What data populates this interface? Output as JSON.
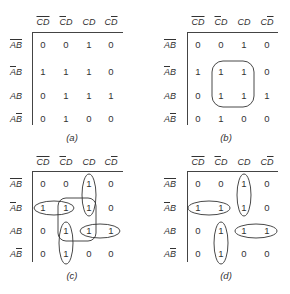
{
  "figure": {
    "column_headers": [
      {
        "parts": [
          {
            "t": "C",
            "bar": true
          },
          {
            "t": "D",
            "bar": true
          }
        ],
        "text": "C̄D̄"
      },
      {
        "parts": [
          {
            "t": "C",
            "bar": true
          },
          {
            "t": "D",
            "bar": false
          }
        ],
        "text": "C̄D"
      },
      {
        "parts": [
          {
            "t": "C",
            "bar": false
          },
          {
            "t": "D",
            "bar": false
          }
        ],
        "text": "CD"
      },
      {
        "parts": [
          {
            "t": "C",
            "bar": false
          },
          {
            "t": "D",
            "bar": true
          }
        ],
        "text": "CD̄"
      }
    ],
    "row_headers": [
      {
        "parts": [
          {
            "t": "A",
            "bar": true
          },
          {
            "t": "B",
            "bar": true
          }
        ],
        "text": "ĀB̄"
      },
      {
        "parts": [
          {
            "t": "A",
            "bar": true
          },
          {
            "t": "B",
            "bar": false
          }
        ],
        "text": "ĀB"
      },
      {
        "parts": [
          {
            "t": "A",
            "bar": false
          },
          {
            "t": "B",
            "bar": false
          }
        ],
        "text": "AB"
      },
      {
        "parts": [
          {
            "t": "A",
            "bar": false
          },
          {
            "t": "B",
            "bar": true
          }
        ],
        "text": "AB̄"
      }
    ],
    "maps": [
      {
        "id": "a",
        "caption": "(a)",
        "cells": [
          [
            "0",
            "0",
            "1",
            "0"
          ],
          [
            "1",
            "1",
            "1",
            "0"
          ],
          [
            "0",
            "1",
            "1",
            "1"
          ],
          [
            "0",
            "1",
            "0",
            "0"
          ]
        ],
        "groupings": []
      },
      {
        "id": "b",
        "caption": "(b)",
        "cells": [
          [
            "0",
            "0",
            "1",
            "0"
          ],
          [
            "1",
            "1",
            "1",
            "0"
          ],
          [
            "0",
            "1",
            "1",
            "1"
          ],
          [
            "0",
            "1",
            "0",
            "0"
          ]
        ],
        "groupings": [
          {
            "shape": "rounded-rect",
            "rows": [
              1,
              2
            ],
            "cols": [
              1,
              2
            ]
          }
        ]
      },
      {
        "id": "c",
        "caption": "(c)",
        "cells": [
          [
            "0",
            "0",
            "1",
            "0"
          ],
          [
            "1",
            "1",
            "1",
            "0"
          ],
          [
            "0",
            "1",
            "1",
            "1"
          ],
          [
            "0",
            "1",
            "0",
            "0"
          ]
        ],
        "groupings": [
          {
            "shape": "ellipse",
            "rows": [
              0,
              1
            ],
            "cols": [
              2,
              2
            ]
          },
          {
            "shape": "ellipse",
            "rows": [
              1,
              1
            ],
            "cols": [
              0,
              1
            ]
          },
          {
            "shape": "rounded-rect",
            "rows": [
              1,
              2
            ],
            "cols": [
              1,
              2
            ]
          },
          {
            "shape": "ellipse",
            "rows": [
              2,
              3
            ],
            "cols": [
              1,
              1
            ]
          },
          {
            "shape": "ellipse",
            "rows": [
              2,
              2
            ],
            "cols": [
              2,
              3
            ]
          }
        ]
      },
      {
        "id": "d",
        "caption": "(d)",
        "cells": [
          [
            "0",
            "0",
            "1",
            "0"
          ],
          [
            "1",
            "1",
            "1",
            "0"
          ],
          [
            "0",
            "1",
            "1",
            "1"
          ],
          [
            "0",
            "1",
            "0",
            "0"
          ]
        ],
        "groupings": [
          {
            "shape": "ellipse",
            "rows": [
              0,
              1
            ],
            "cols": [
              2,
              2
            ]
          },
          {
            "shape": "ellipse",
            "rows": [
              1,
              1
            ],
            "cols": [
              0,
              1
            ]
          },
          {
            "shape": "ellipse",
            "rows": [
              2,
              3
            ],
            "cols": [
              1,
              1
            ]
          },
          {
            "shape": "ellipse",
            "rows": [
              2,
              2
            ],
            "cols": [
              2,
              3
            ]
          }
        ]
      }
    ]
  }
}
